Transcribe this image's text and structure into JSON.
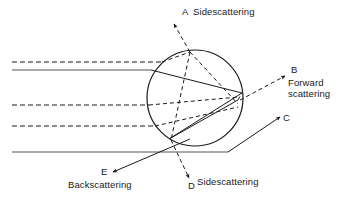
{
  "figure": {
    "colors": {
      "stroke": "#1a1a1a",
      "background": "#ffffff",
      "text": "#1a1a1a"
    },
    "particle": {
      "shape": "circle",
      "center_x": 195,
      "center_y": 98,
      "radius": 48
    },
    "labels": {
      "a_letter": "A",
      "a_text": "Sidescattering",
      "b_letter": "B",
      "b_text_line1": "Forward",
      "b_text_line2": "scattering",
      "c_letter": "C",
      "d_letter": "D",
      "d_text": "Sidescattering",
      "e_letter": "E",
      "e_text": "Backscattering"
    },
    "incident_rays": [
      {
        "name": "ray-top-dashed",
        "y": 62,
        "style": "dashed",
        "x_start": 12,
        "x_end": 160
      },
      {
        "name": "ray-top-solid",
        "y": 70,
        "style": "solid",
        "x_start": 12,
        "x_end": 152
      },
      {
        "name": "ray-middle-dashed-upper",
        "y": 105,
        "style": "dashed",
        "x_start": 12,
        "x_end": 150
      },
      {
        "name": "ray-middle-dashed-lower",
        "y": 126,
        "style": "dashed",
        "x_start": 12,
        "x_end": 155
      },
      {
        "name": "ray-bottom-solid",
        "y": 152,
        "style": "solid",
        "x_start": 12,
        "x_end": 228
      }
    ],
    "exit_rays": [
      {
        "name": "exit-ray-a",
        "label": "A",
        "style": "dashed",
        "direction": "up-left"
      },
      {
        "name": "exit-ray-b",
        "label": "B",
        "style": "dashed",
        "direction": "up-right"
      },
      {
        "name": "exit-ray-c",
        "label": "C",
        "style": "solid",
        "direction": "up-right"
      },
      {
        "name": "exit-ray-d",
        "label": "D",
        "style": "dashed",
        "direction": "down"
      },
      {
        "name": "exit-ray-e",
        "label": "E",
        "style": "solid",
        "direction": "down-left"
      }
    ]
  }
}
